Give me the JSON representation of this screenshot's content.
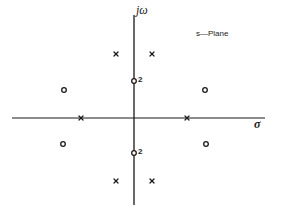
{
  "diagram": {
    "title": "s—Plane",
    "type": "pole-zero plot",
    "axes": {
      "horizontal_label": "σ",
      "vertical_label": "jω",
      "origin_px": [
        134,
        118
      ],
      "horizontal_extent_px": [
        12,
        265
      ],
      "vertical_extent_px": [
        15,
        205
      ]
    },
    "poles": [
      {
        "id": "pole-upper-left",
        "symbol": "x",
        "px": [
          116,
          54
        ]
      },
      {
        "id": "pole-upper-right",
        "symbol": "x",
        "px": [
          152,
          54
        ]
      },
      {
        "id": "pole-real-left",
        "symbol": "x",
        "px": [
          81,
          118
        ]
      },
      {
        "id": "pole-real-right",
        "symbol": "x",
        "px": [
          187,
          118
        ]
      },
      {
        "id": "pole-lower-left",
        "symbol": "x",
        "px": [
          116,
          181
        ]
      },
      {
        "id": "pole-lower-right",
        "symbol": "x",
        "px": [
          152,
          181
        ]
      }
    ],
    "zeros": [
      {
        "id": "zero-upper-left",
        "symbol": "o",
        "px": [
          64,
          90
        ]
      },
      {
        "id": "zero-upper-right",
        "symbol": "o",
        "px": [
          205,
          90
        ]
      },
      {
        "id": "zero-lower-left",
        "symbol": "o",
        "px": [
          63,
          144
        ]
      },
      {
        "id": "zero-lower-right",
        "symbol": "o",
        "px": [
          206,
          144
        ]
      },
      {
        "id": "zero-imag-upper",
        "symbol": "o",
        "px": [
          134,
          81
        ],
        "multiplicity": "2"
      },
      {
        "id": "zero-imag-lower",
        "symbol": "o",
        "px": [
          134,
          153
        ],
        "multiplicity": "2"
      }
    ],
    "multiplicity_labels": [
      "2",
      "2"
    ],
    "colors": {
      "ink": "#1a1a1a",
      "background": "#ffffff"
    }
  }
}
